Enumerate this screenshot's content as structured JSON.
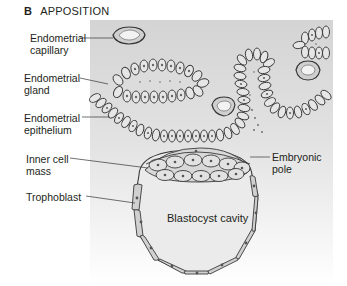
{
  "figure": {
    "panel_letter": "B",
    "panel_title": "APPOSITION"
  },
  "labels": {
    "endometrial_capillary": [
      "Endometrial",
      "capillary"
    ],
    "endometrial_gland": [
      "Endometrial",
      "gland"
    ],
    "endometrial_epithelium": [
      "Endometrial",
      "epithelium"
    ],
    "inner_cell_mass": [
      "Inner cell",
      "mass"
    ],
    "trophoblast": [
      "Trophoblast"
    ],
    "embryonic_pole": [
      "Embryonic",
      "pole"
    ],
    "blastocyst_cavity": "Blastocyst cavity"
  },
  "colors": {
    "panel_bg_top": "#d6d6d6",
    "panel_bg_bottom": "#ffffff",
    "cell_fill": "#e4e4e4",
    "cell_stroke": "#3a3a3a",
    "cavity_fill": "#e9e9e9",
    "text": "#231f20"
  }
}
